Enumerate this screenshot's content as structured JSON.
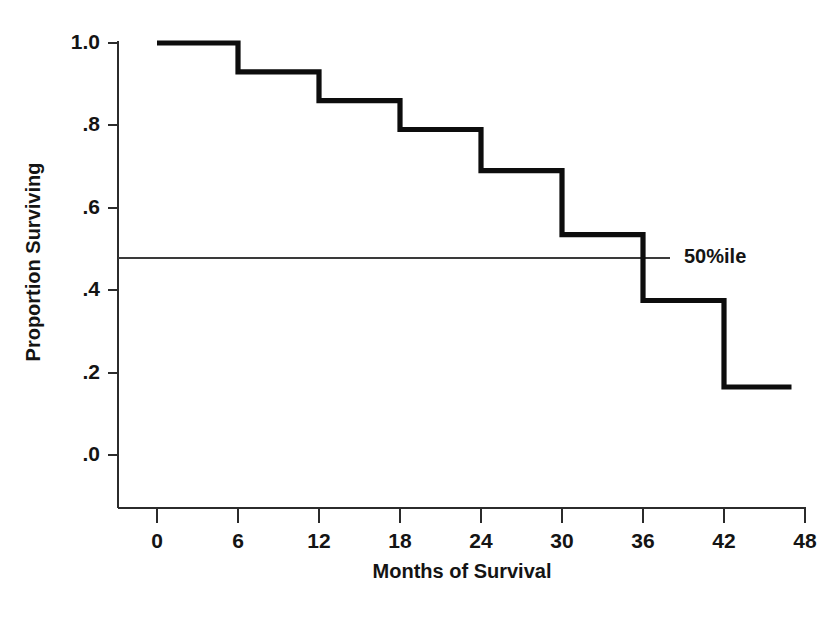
{
  "chart_data": {
    "type": "line",
    "subtype": "kaplan-meier-step",
    "title": "",
    "xlabel": "Months of Survival",
    "ylabel": "Proportion Surviving",
    "xlim": [
      0,
      48
    ],
    "ylim": [
      0.0,
      1.0
    ],
    "grid": false,
    "legend_position": "none",
    "x_ticks": [
      0,
      6,
      12,
      18,
      24,
      30,
      36,
      42,
      48
    ],
    "x_tick_labels": [
      "0",
      "6",
      "12",
      "18",
      "24",
      "30",
      "36",
      "42",
      "48"
    ],
    "y_ticks": [
      0.0,
      0.2,
      0.4,
      0.6,
      0.8,
      1.0
    ],
    "y_tick_labels": [
      ".0",
      ".2",
      ".4",
      ".6",
      ".8",
      "1.0"
    ],
    "series": [
      {
        "name": "Survival",
        "step": "post",
        "x": [
          0,
          6,
          12,
          18,
          24,
          30,
          36,
          42,
          47
        ],
        "y": [
          1.0,
          0.93,
          0.86,
          0.79,
          0.69,
          0.535,
          0.375,
          0.165,
          0.165
        ],
        "points": [
          {
            "months": 0,
            "proportion": 1.0
          },
          {
            "months": 6,
            "proportion": 0.93
          },
          {
            "months": 12,
            "proportion": 0.86
          },
          {
            "months": 18,
            "proportion": 0.79
          },
          {
            "months": 24,
            "proportion": 0.69
          },
          {
            "months": 30,
            "proportion": 0.535
          },
          {
            "months": 36,
            "proportion": 0.375
          },
          {
            "months": 42,
            "proportion": 0.165
          },
          {
            "months": 47,
            "proportion": 0.165
          }
        ]
      }
    ],
    "reference_lines": [
      {
        "name": "median-survival",
        "orientation": "horizontal",
        "value": 0.5,
        "label": "50%ile",
        "x_start": 0,
        "x_end": 41
      }
    ],
    "annotations": [
      {
        "text": "50%ile",
        "x": 42.5,
        "y": 0.5
      }
    ],
    "colors": {
      "curve": "#0d0d0d",
      "axis": "#2b2b2b",
      "reference_line": "#3a3a3a",
      "text": "#141414",
      "background": "#ffffff"
    }
  }
}
